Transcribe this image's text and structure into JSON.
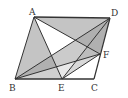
{
  "diagram": {
    "type": "geometry",
    "shape": "parallelogram ABCD",
    "points": {
      "A": {
        "x": 34,
        "y": 17,
        "label": "A",
        "lx": 29,
        "ly": 15
      },
      "D": {
        "x": 110,
        "y": 18,
        "label": "D",
        "lx": 111,
        "ly": 16
      },
      "B": {
        "x": 15,
        "y": 79,
        "label": "B",
        "lx": 9,
        "ly": 91
      },
      "E": {
        "x": 62,
        "y": 79,
        "label": "E",
        "lx": 58,
        "ly": 91
      },
      "C": {
        "x": 94,
        "y": 79,
        "label": "C",
        "lx": 91,
        "ly": 91
      },
      "F": {
        "x": 100,
        "y": 54,
        "label": "F",
        "lx": 103,
        "ly": 58
      }
    },
    "segments": [
      "AB",
      "BC",
      "CD",
      "DA",
      "AE",
      "AF",
      "BD",
      "BF",
      "DE",
      "EF"
    ],
    "colors": {
      "stroke": "#333333",
      "shade_light": "#c8c8c8",
      "shade_mid": "#a8a8a8",
      "shade_dark": "#888888",
      "background": "#ffffff"
    }
  }
}
